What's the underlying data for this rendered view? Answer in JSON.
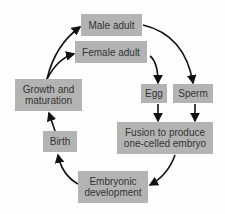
{
  "diagram": {
    "box_color": "#b3b3b3",
    "nodes": {
      "male_adult": "Male adult",
      "female_adult": "Female adult",
      "growth": "Growth and maturation",
      "egg": "Egg",
      "sperm": "Sperm",
      "fusion": "Fusion to produce one-celled embryo",
      "embryonic": "Embryonic development",
      "birth": "Birth"
    },
    "edges": [
      {
        "from": "growth",
        "to": "male_adult"
      },
      {
        "from": "growth",
        "to": "female_adult"
      },
      {
        "from": "male_adult",
        "to": "sperm"
      },
      {
        "from": "female_adult",
        "to": "egg"
      },
      {
        "from": "egg",
        "to": "fusion"
      },
      {
        "from": "sperm",
        "to": "fusion"
      },
      {
        "from": "fusion",
        "to": "embryonic"
      },
      {
        "from": "embryonic",
        "to": "birth"
      },
      {
        "from": "birth",
        "to": "growth"
      }
    ]
  }
}
